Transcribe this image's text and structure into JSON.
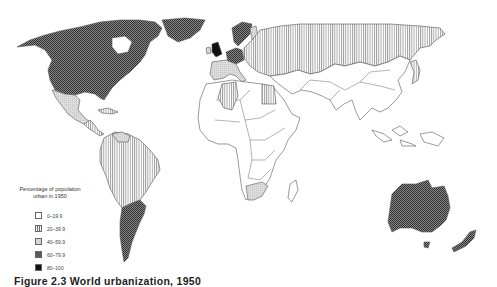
{
  "figure": {
    "caption": "Figure 2.3 World urbanization, 1950"
  },
  "legend": {
    "title_line1": "Percentage of population",
    "title_line2": "urban in 1950",
    "classes": [
      {
        "label": "0–19.9",
        "pattern": "blank",
        "color": "#ffffff"
      },
      {
        "label": "20–39.9",
        "pattern": "vertical-lines",
        "color": "#777777"
      },
      {
        "label": "40–59.9",
        "pattern": "light-stipple",
        "color": "#d4d4d4"
      },
      {
        "label": "60–79.9",
        "pattern": "checker",
        "color": "#4a4a4a"
      },
      {
        "label": "80–100",
        "pattern": "solid",
        "color": "#111111"
      }
    ]
  },
  "regions": [
    {
      "name": "North America (USA/Canada)",
      "class": "60–79.9"
    },
    {
      "name": "Mexico",
      "class": "40–59.9"
    },
    {
      "name": "Central America/Caribbean",
      "class": "20–39.9"
    },
    {
      "name": "Venezuela",
      "class": "40–59.9"
    },
    {
      "name": "Brazil & northern South America",
      "class": "20–39.9"
    },
    {
      "name": "Argentina/Chile/Uruguay",
      "class": "60–79.9"
    },
    {
      "name": "United Kingdom",
      "class": "80–100"
    },
    {
      "name": "Germany/Benelux",
      "class": "60–79.9"
    },
    {
      "name": "Scandinavia",
      "class": "60–79.9"
    },
    {
      "name": "France/Iberia/Italy",
      "class": "40–59.9"
    },
    {
      "name": "Eastern Europe & USSR",
      "class": "20–39.9"
    },
    {
      "name": "Algeria/Egypt",
      "class": "20–39.9"
    },
    {
      "name": "South Africa",
      "class": "40–59.9"
    },
    {
      "name": "Japan",
      "class": "20–39.9"
    },
    {
      "name": "Australia & New Zealand",
      "class": "60–79.9"
    },
    {
      "name": "Rest of Africa & Asia",
      "class": "0–19.9"
    }
  ]
}
